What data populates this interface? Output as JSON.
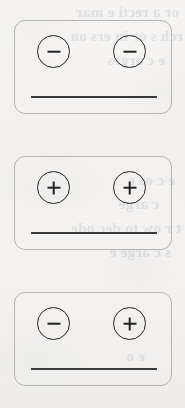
{
  "figure": {
    "background_color": "#f3f2f0",
    "card_border_color": "#b4b4b4",
    "symbol_color": "#232323",
    "rule_color": "#3a3a3a",
    "panel_count": 3
  },
  "bleed_through": {
    "note": "faint mirrored text showing through from the reverse side of the scanned page",
    "color": "#4a5570",
    "lines": [
      {
        "text": "or a recti e mar",
        "left": 6,
        "top": 2
      },
      {
        "text": "rch s or in ers on",
        "left": 2,
        "top": 26
      },
      {
        "text": "e c arges",
        "left": 20,
        "top": 50
      },
      {
        "text": "e c os e",
        "left": 10,
        "top": 170
      },
      {
        "text": "c arge",
        "left": 26,
        "top": 194
      },
      {
        "text": "t r ow to dec ode",
        "left": 4,
        "top": 218
      },
      {
        "text": "s c arge e",
        "left": 14,
        "top": 242
      },
      {
        "text": "e o",
        "left": 40,
        "top": 346
      }
    ]
  },
  "cards": [
    {
      "id": "card-1",
      "name": "negative-negative-panel",
      "charges": [
        {
          "position": "left",
          "sign": "minus",
          "label": "−"
        },
        {
          "position": "right",
          "sign": "minus",
          "label": "−"
        }
      ],
      "has_baseline_rule": true
    },
    {
      "id": "card-2",
      "name": "positive-positive-panel",
      "charges": [
        {
          "position": "left",
          "sign": "plus",
          "label": "+"
        },
        {
          "position": "right",
          "sign": "plus",
          "label": "+"
        }
      ],
      "has_baseline_rule": true
    },
    {
      "id": "card-3",
      "name": "negative-positive-panel",
      "charges": [
        {
          "position": "left",
          "sign": "minus",
          "label": "−"
        },
        {
          "position": "right",
          "sign": "plus",
          "label": "+"
        }
      ],
      "has_baseline_rule": true
    }
  ]
}
